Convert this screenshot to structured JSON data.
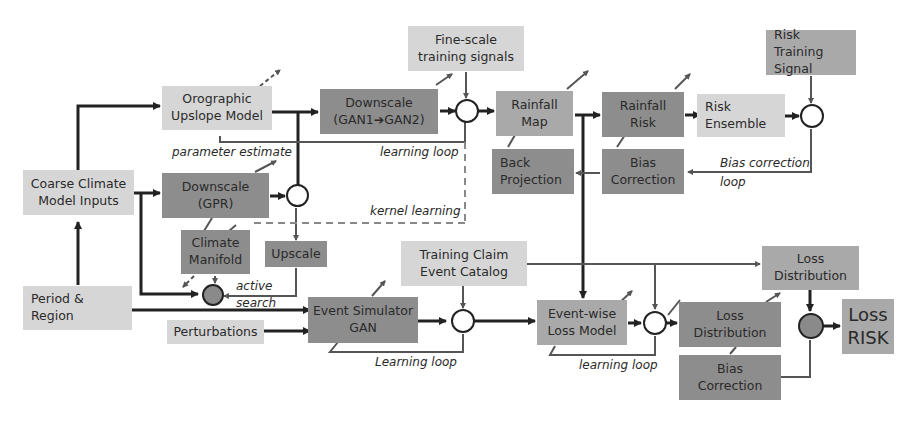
{
  "diagram": {
    "colors": {
      "light_box": "#d6d6d6",
      "mid_box": "#a9a9a9",
      "dark_box": "#8d8d8d",
      "line": "#222222",
      "thin_line": "#555555",
      "node_filled": "#8a8a8a"
    },
    "boxes": {
      "coarse_climate": "Coarse Climate Model Inputs",
      "period_region": "Period & Region",
      "orographic": "Orographic Upslope Model",
      "downscale_gpr": "Downscale (GPR)",
      "climate_manifold": "Climate Manifold",
      "upscale": "Upscale",
      "perturbations": "Perturbations",
      "downscale_gan": "Downscale (GAN1➔GAN2)",
      "fine_scale": "Fine-scale training signals",
      "rainfall_map": "Rainfall Map",
      "back_projection": "Back Projection",
      "rainfall_risk": "Rainfall Risk",
      "bias_correction_top": "Bias Correction",
      "risk_ensemble": "Risk Ensemble",
      "risk_training": "Risk Training Signal",
      "event_simulator": "Event Simulator GAN",
      "training_claim": "Training Claim Event  Catalog",
      "event_wise_loss": "Event-wise Loss Model",
      "loss_distribution_top": "Loss Distribution",
      "loss_distribution": "Loss Distribution",
      "bias_correction_bottom": "Bias Correction",
      "loss_risk": "Loss RISK"
    },
    "labels": {
      "parameter_estimate": "parameter estimate",
      "learning_loop_top": "learning loop",
      "kernel_learning": "kernel learning",
      "active_search_1": "active",
      "active_search_2": "search",
      "bias_correction_loop_1": "Bias correction",
      "bias_correction_loop_2": "loop",
      "learning_loop_event": "Learning loop",
      "learning_loop_loss": "learning loop"
    }
  }
}
